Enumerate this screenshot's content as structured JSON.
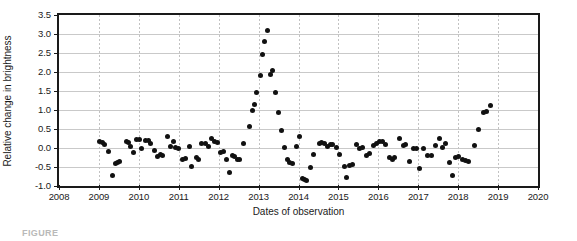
{
  "chart_data": {
    "type": "scatter",
    "title": "",
    "xlabel": "Dates of observation",
    "ylabel": "Relative change in brightness",
    "xlim": [
      2008,
      2020
    ],
    "ylim": [
      -1.0,
      3.5
    ],
    "grid": true,
    "legend": null,
    "xticks": [
      "2008",
      "2009",
      "2010",
      "2011",
      "2012",
      "2013",
      "2014",
      "2015",
      "2016",
      "2017",
      "2018",
      "2019",
      "2020"
    ],
    "yticks": [
      "3.5",
      "3.0",
      "2.5",
      "2.0",
      "1.5",
      "1.0",
      "0.5",
      "0.0",
      "-0.5",
      "-1.0"
    ],
    "marker": "filled-circle",
    "marker_color": "#111111",
    "series": [
      {
        "name": "Relative change in brightness",
        "points": [
          [
            2009.02,
            0.17
          ],
          [
            2009.08,
            0.15
          ],
          [
            2009.14,
            0.08
          ],
          [
            2009.25,
            -0.09
          ],
          [
            2009.33,
            -0.72
          ],
          [
            2009.42,
            -0.41
          ],
          [
            2009.46,
            -0.37
          ],
          [
            2009.51,
            -0.36
          ],
          [
            2009.68,
            0.17
          ],
          [
            2009.74,
            0.14
          ],
          [
            2009.8,
            0.05
          ],
          [
            2009.86,
            -0.12
          ],
          [
            2009.95,
            0.22
          ],
          [
            2010.01,
            0.23
          ],
          [
            2010.06,
            -0.02
          ],
          [
            2010.17,
            0.2
          ],
          [
            2010.23,
            0.21
          ],
          [
            2010.29,
            0.13
          ],
          [
            2010.4,
            -0.06
          ],
          [
            2010.47,
            -0.23
          ],
          [
            2010.55,
            -0.18
          ],
          [
            2010.6,
            -0.21
          ],
          [
            2010.73,
            0.31
          ],
          [
            2010.8,
            0.05
          ],
          [
            2010.87,
            0.17
          ],
          [
            2010.93,
            0.02
          ],
          [
            2011.0,
            -0.02
          ],
          [
            2011.09,
            -0.29
          ],
          [
            2011.16,
            -0.27
          ],
          [
            2011.26,
            0.04
          ],
          [
            2011.32,
            -0.48
          ],
          [
            2011.44,
            -0.26
          ],
          [
            2011.5,
            -0.29
          ],
          [
            2011.58,
            0.11
          ],
          [
            2011.66,
            0.12
          ],
          [
            2011.74,
            0.05
          ],
          [
            2011.82,
            0.24
          ],
          [
            2011.9,
            0.17
          ],
          [
            2011.97,
            0.15
          ],
          [
            2012.04,
            -0.13
          ],
          [
            2012.12,
            -0.1
          ],
          [
            2012.2,
            -0.3
          ],
          [
            2012.26,
            -0.65
          ],
          [
            2012.34,
            -0.21
          ],
          [
            2012.4,
            -0.23
          ],
          [
            2012.46,
            -0.29
          ],
          [
            2012.52,
            -0.31
          ],
          [
            2012.62,
            0.12
          ],
          [
            2012.76,
            0.56
          ],
          [
            2012.84,
            0.98
          ],
          [
            2012.89,
            1.15
          ],
          [
            2012.96,
            1.46
          ],
          [
            2013.04,
            1.92
          ],
          [
            2013.1,
            2.47
          ],
          [
            2013.16,
            2.81
          ],
          [
            2013.22,
            3.08
          ],
          [
            2013.3,
            1.93
          ],
          [
            2013.36,
            2.03
          ],
          [
            2013.42,
            1.47
          ],
          [
            2013.49,
            0.94
          ],
          [
            2013.57,
            0.46
          ],
          [
            2013.66,
            0.02
          ],
          [
            2013.72,
            -0.31
          ],
          [
            2013.78,
            -0.38
          ],
          [
            2013.86,
            -0.41
          ],
          [
            2013.95,
            0.05
          ],
          [
            2014.02,
            0.3
          ],
          [
            2014.1,
            -0.8
          ],
          [
            2014.16,
            -0.84
          ],
          [
            2014.21,
            -0.86
          ],
          [
            2014.3,
            -0.52
          ],
          [
            2014.38,
            -0.17
          ],
          [
            2014.52,
            0.12
          ],
          [
            2014.58,
            0.14
          ],
          [
            2014.64,
            0.13
          ],
          [
            2014.72,
            0.05
          ],
          [
            2014.79,
            0.1
          ],
          [
            2014.86,
            0.09
          ],
          [
            2014.94,
            0.02
          ],
          [
            2015.03,
            -0.17
          ],
          [
            2015.14,
            -0.48
          ],
          [
            2015.21,
            -0.77
          ],
          [
            2015.29,
            -0.46
          ],
          [
            2015.35,
            -0.43
          ],
          [
            2015.46,
            0.1
          ],
          [
            2015.54,
            0.0
          ],
          [
            2015.61,
            0.02
          ],
          [
            2015.7,
            -0.2
          ],
          [
            2015.78,
            -0.14
          ],
          [
            2015.88,
            0.07
          ],
          [
            2015.96,
            0.12
          ],
          [
            2016.03,
            0.17
          ],
          [
            2016.1,
            0.16
          ],
          [
            2016.18,
            0.1
          ],
          [
            2016.28,
            -0.24
          ],
          [
            2016.35,
            -0.29
          ],
          [
            2016.41,
            -0.26
          ],
          [
            2016.52,
            0.26
          ],
          [
            2016.62,
            0.06
          ],
          [
            2016.69,
            0.09
          ],
          [
            2016.78,
            -0.35
          ],
          [
            2016.88,
            0.0
          ],
          [
            2016.95,
            -0.02
          ],
          [
            2017.04,
            -0.53
          ],
          [
            2017.14,
            0.0
          ],
          [
            2017.24,
            -0.19
          ],
          [
            2017.33,
            -0.21
          ],
          [
            2017.44,
            0.07
          ],
          [
            2017.52,
            0.25
          ],
          [
            2017.6,
            0.02
          ],
          [
            2017.68,
            0.11
          ],
          [
            2017.78,
            -0.38
          ],
          [
            2017.86,
            -0.72
          ],
          [
            2017.94,
            -0.24
          ],
          [
            2018.02,
            -0.23
          ],
          [
            2018.1,
            -0.3
          ],
          [
            2018.18,
            -0.33
          ],
          [
            2018.26,
            -0.36
          ],
          [
            2018.4,
            0.07
          ],
          [
            2018.52,
            0.5
          ],
          [
            2018.64,
            0.93
          ],
          [
            2018.7,
            0.97
          ],
          [
            2018.8,
            1.11
          ]
        ]
      }
    ]
  },
  "caption": {
    "text": "FIGURE"
  }
}
